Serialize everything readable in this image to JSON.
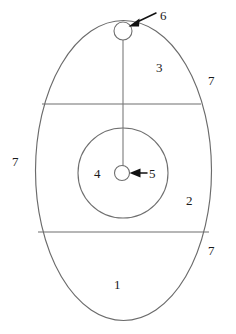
{
  "figure": {
    "background_color": "#ffffff",
    "outline_color": "#6b6b6b",
    "arrow_color": "#111111",
    "label_color": "#1a1a1a",
    "labels": [
      {
        "id": "label-1",
        "text": "1",
        "x": 114,
        "y": 278,
        "note": "lower region of oval"
      },
      {
        "id": "label-2",
        "text": "2",
        "x": 186,
        "y": 194,
        "note": "right middle region"
      },
      {
        "id": "label-3",
        "text": "3",
        "x": 156,
        "y": 61,
        "note": "upper region"
      },
      {
        "id": "label-4",
        "text": "4",
        "x": 94,
        "y": 167,
        "note": "inside inner circle"
      },
      {
        "id": "label-5",
        "text": "5",
        "x": 149,
        "y": 167,
        "note": "arrow to center dot"
      },
      {
        "id": "label-6",
        "text": "6",
        "x": 160,
        "y": 9,
        "note": "arrow to top circle"
      },
      {
        "id": "label-7a",
        "text": "7",
        "x": 208,
        "y": 74,
        "note": "outline upper right"
      },
      {
        "id": "label-7b",
        "text": "7",
        "x": 12,
        "y": 155,
        "note": "outline left"
      },
      {
        "id": "label-7c",
        "text": "7",
        "x": 208,
        "y": 244,
        "note": "outline lower right"
      }
    ],
    "shapes": {
      "outer_ellipse": {
        "cx": 123.5,
        "cy": 170.5,
        "rx": 88,
        "ry": 150
      },
      "inner_circle": {
        "cx": 123,
        "cy": 173,
        "r": 45
      },
      "center_dot_circle": {
        "cx": 122,
        "cy": 173,
        "r": 7.5
      },
      "top_circle": {
        "cx": 123,
        "cy": 31,
        "r": 9
      },
      "upper_divider": {
        "x1": 42,
        "y1": 104,
        "x2": 201,
        "y2": 104
      },
      "lower_divider": {
        "x1": 38,
        "y1": 232,
        "x2": 209,
        "y2": 232
      },
      "vertical_stem": {
        "x1": 123,
        "y1": 40,
        "x2": 123,
        "y2": 166
      }
    },
    "arrows": [
      {
        "id": "arrow-to-6",
        "from_x": 155,
        "from_y": 14,
        "to_x": 131,
        "to_y": 25
      },
      {
        "id": "arrow-to-5",
        "from_x": 146,
        "from_y": 173,
        "to_x": 131,
        "to_y": 173
      }
    ]
  }
}
